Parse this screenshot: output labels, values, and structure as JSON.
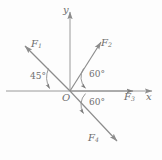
{
  "figure": {
    "background_color": "#fdfdfd",
    "line_color": "#8c8c8c",
    "text_color": "#6d6d6d"
  },
  "axes": {
    "x_label": "x",
    "y_label": "y",
    "origin_label": "O",
    "x_axis_name": "horizontal-axis",
    "y_axis_name": "vertical-axis"
  },
  "forces": [
    {
      "label": "F",
      "sub": "1",
      "angle_deg": 135,
      "direction": "up-left"
    },
    {
      "label": "F",
      "sub": "2",
      "angle_deg": 60,
      "direction": "up-right"
    },
    {
      "label": "F",
      "sub": "3",
      "angle_deg": 0,
      "direction": "right"
    },
    {
      "label": "F",
      "sub": "4",
      "angle_deg": -60,
      "direction": "down-right"
    }
  ],
  "angles": [
    {
      "value": "45°",
      "between": "F1-and-negative-x-axis"
    },
    {
      "value": "60°",
      "between": "F2-and-positive-x-axis"
    },
    {
      "value": "60°",
      "between": "F4-and-positive-x-axis"
    }
  ]
}
